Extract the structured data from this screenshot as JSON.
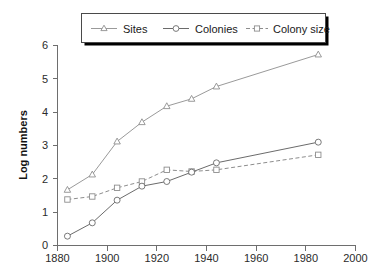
{
  "chart_data": {
    "type": "line",
    "title": "",
    "subtitle": "",
    "xlabel": "",
    "ylabel": "Log numbers",
    "xlim": [
      1880,
      2000
    ],
    "ylim": [
      0,
      6
    ],
    "xticks": [
      1880,
      1900,
      1920,
      1940,
      1960,
      1980,
      2000
    ],
    "xtick_labels": [
      "1880",
      "1900",
      "1920",
      "1940",
      "1960",
      "1980",
      "2000"
    ],
    "yticks": [
      0,
      1,
      2,
      3,
      4,
      5,
      6
    ],
    "ytick_labels": [
      "0",
      "1",
      "2",
      "3",
      "4",
      "5",
      "6"
    ],
    "grid": false,
    "legend_position": "top-center",
    "x": [
      1884,
      1894,
      1904,
      1914,
      1924,
      1934,
      1944,
      1985
    ],
    "series": [
      {
        "name": "Sites",
        "marker": "triangle",
        "linestyle": "solid",
        "color": "#9a9a9a",
        "values": [
          1.67,
          2.13,
          3.12,
          3.7,
          4.18,
          4.4,
          4.77,
          5.73
        ]
      },
      {
        "name": "Colonies",
        "marker": "circle",
        "linestyle": "solid",
        "color": "#6b6b6b",
        "values": [
          0.28,
          0.68,
          1.36,
          1.78,
          1.92,
          2.2,
          2.48,
          3.1
        ]
      },
      {
        "name": "Colony size",
        "marker": "square",
        "linestyle": "dashed",
        "color": "#8d8d8d",
        "values": [
          1.38,
          1.47,
          1.73,
          1.92,
          2.27,
          2.22,
          2.27,
          2.72
        ]
      }
    ],
    "annotations": []
  },
  "legend": {
    "entries": [
      {
        "label": "Sites"
      },
      {
        "label": "Colonies"
      },
      {
        "label": "Colony size"
      }
    ]
  },
  "axes": {
    "y_title": "Log numbers"
  }
}
